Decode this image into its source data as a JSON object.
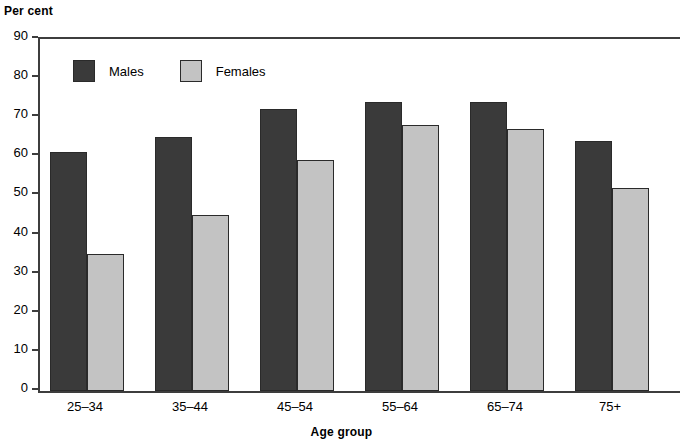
{
  "chart_data": {
    "type": "bar",
    "title": "",
    "subtitle": "",
    "ylabel": "Per cent",
    "xlabel": "Age group",
    "categories": [
      "25–34",
      "35–44",
      "45–54",
      "55–64",
      "65–74",
      "75+"
    ],
    "series": [
      {
        "name": "Males",
        "values": [
          61,
          65,
          72,
          74,
          74,
          64
        ],
        "color": "#3a3a3a"
      },
      {
        "name": "Females",
        "values": [
          35,
          45,
          59,
          68,
          67,
          52
        ],
        "color": "#c3c3c3"
      }
    ],
    "ylim": [
      0,
      90
    ],
    "ytick_values": [
      0,
      10,
      20,
      30,
      40,
      50,
      60,
      70,
      80,
      90
    ],
    "ytick_labels": [
      "0",
      "10",
      "20",
      "30",
      "40",
      "50",
      "60",
      "70",
      "80",
      "90"
    ],
    "grid": false,
    "legend_position": "upper-left-inside",
    "legend_entries": [
      "Males",
      "Females"
    ],
    "annotations": []
  }
}
